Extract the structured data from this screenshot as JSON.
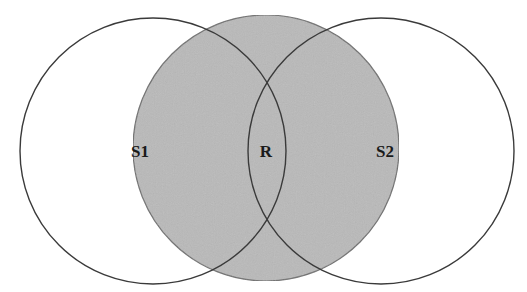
{
  "diagram": {
    "type": "venn",
    "colors": {
      "background": "#ffffff",
      "outline": "#3a3a3a",
      "shaded_fill": "#b9b9b9",
      "shaded_outline": "#6e6e6e",
      "label": "#1a1a1a"
    },
    "circles": [
      {
        "id": "S1",
        "label": "S1",
        "cx": 153,
        "cy": 151,
        "r": 133,
        "shaded": false
      },
      {
        "id": "R",
        "label": "R",
        "cx": 266,
        "cy": 148,
        "r": 133,
        "shaded": true
      },
      {
        "id": "S2",
        "label": "S2",
        "cx": 381,
        "cy": 151,
        "r": 133,
        "shaded": false
      }
    ],
    "labels": [
      {
        "text": "S1",
        "x": 140,
        "y": 157
      },
      {
        "text": "R",
        "x": 266,
        "y": 157
      },
      {
        "text": "S2",
        "x": 385,
        "y": 157
      }
    ]
  }
}
